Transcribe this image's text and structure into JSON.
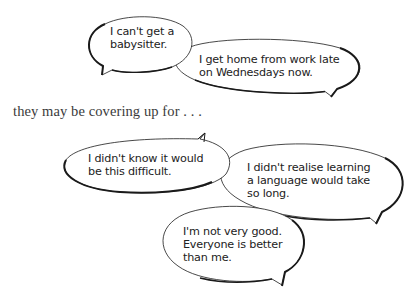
{
  "colors": {
    "outline": "#1a1a1a",
    "bubble_fill": "#ffffff",
    "text": "#222222",
    "narration_text": "#3a3a3a"
  },
  "top_bubbles": [
    {
      "id": "babysitter",
      "text": "I can't get a\nbabysitter."
    },
    {
      "id": "home-late",
      "text": "I get home from work late\non Wednesdays now."
    }
  ],
  "narration": "they may be covering up for . . .",
  "bottom_bubbles": [
    {
      "id": "difficult",
      "text": "I didn't know it would\nbe this difficult."
    },
    {
      "id": "so-long",
      "text": "I didn't realise learning\na language would take\nso long."
    },
    {
      "id": "not-good",
      "text": "I'm not very good.\nEveryone is better\nthan me."
    }
  ]
}
